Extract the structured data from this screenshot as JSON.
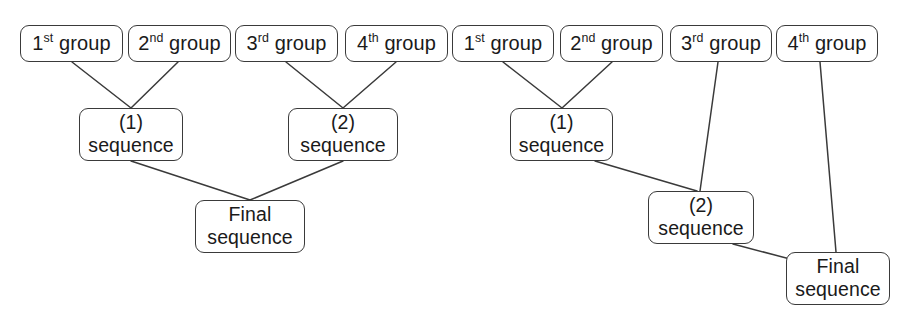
{
  "diagram": {
    "stroke_color": "#3a3a3a",
    "background_color": "#ffffff",
    "text_color": "#1a1a1a",
    "schemes": [
      {
        "id": "balanced-tree",
        "name": "Balanced pairwise assembly",
        "nodes": {
          "group1": {
            "ordinal": "1",
            "suffix": "st",
            "word": "group"
          },
          "group2": {
            "ordinal": "2",
            "suffix": "nd",
            "word": "group"
          },
          "group3": {
            "ordinal": "3",
            "suffix": "rd",
            "word": "group"
          },
          "group4": {
            "ordinal": "4",
            "suffix": "th",
            "word": "group"
          },
          "seq1": {
            "line1": "(1)",
            "line2": "sequence"
          },
          "seq2": {
            "line1": "(2)",
            "line2": "sequence"
          },
          "final": {
            "line1": "Final",
            "line2": "sequence"
          }
        },
        "edges": [
          {
            "from": "group1",
            "to": "seq1"
          },
          {
            "from": "group2",
            "to": "seq1"
          },
          {
            "from": "group3",
            "to": "seq2"
          },
          {
            "from": "group4",
            "to": "seq2"
          },
          {
            "from": "seq1",
            "to": "final"
          },
          {
            "from": "seq2",
            "to": "final"
          }
        ]
      },
      {
        "id": "cascading-tree",
        "name": "Cascading progressive assembly",
        "nodes": {
          "group1": {
            "ordinal": "1",
            "suffix": "st",
            "word": "group"
          },
          "group2": {
            "ordinal": "2",
            "suffix": "nd",
            "word": "group"
          },
          "group3": {
            "ordinal": "3",
            "suffix": "rd",
            "word": "group"
          },
          "group4": {
            "ordinal": "4",
            "suffix": "th",
            "word": "group"
          },
          "seq1": {
            "line1": "(1)",
            "line2": "sequence"
          },
          "seq2": {
            "line1": "(2)",
            "line2": "sequence"
          },
          "final": {
            "line1": "Final",
            "line2": "sequence"
          }
        },
        "edges": [
          {
            "from": "group1",
            "to": "seq1"
          },
          {
            "from": "group2",
            "to": "seq1"
          },
          {
            "from": "seq1",
            "to": "seq2"
          },
          {
            "from": "group3",
            "to": "seq2"
          },
          {
            "from": "seq2",
            "to": "final"
          },
          {
            "from": "group4",
            "to": "final"
          }
        ]
      }
    ]
  }
}
